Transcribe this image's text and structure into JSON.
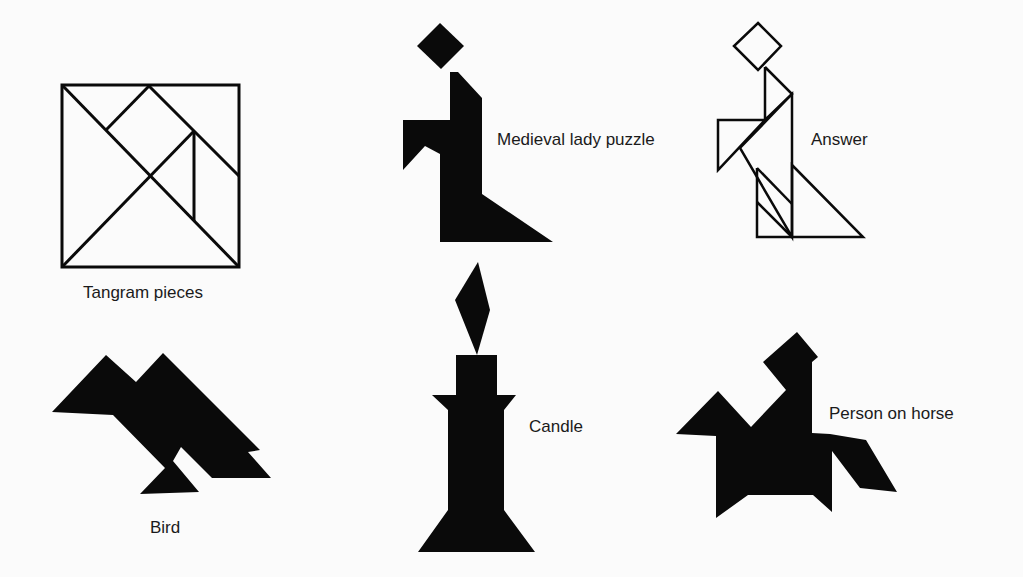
{
  "figures": {
    "tangram_pieces": {
      "label": "Tangram pieces"
    },
    "medieval_lady": {
      "label": "Medieval lady puzzle"
    },
    "answer": {
      "label": "Answer"
    },
    "bird": {
      "label": "Bird"
    },
    "candle": {
      "label": "Candle"
    },
    "person_on_horse": {
      "label": "Person on horse"
    }
  },
  "colors": {
    "ink": "#0a0a0a",
    "background": "#fbfbfb"
  }
}
